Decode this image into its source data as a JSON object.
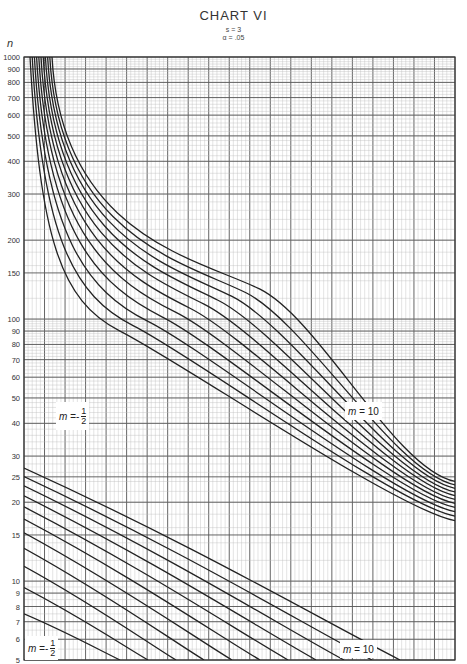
{
  "chart_data": {
    "type": "line",
    "title": "CHART VI",
    "subtitle": [
      "s = 3",
      "α = .05"
    ],
    "ylabel": "n",
    "xlabel": "",
    "yscale": "log",
    "ylim": [
      5,
      1000
    ],
    "y_ticks": [
      1000,
      900,
      800,
      700,
      600,
      500,
      400,
      300,
      200,
      150,
      100,
      90,
      80,
      70,
      60,
      50,
      40,
      30,
      25,
      20,
      15,
      10,
      9,
      8,
      7,
      6,
      5
    ],
    "grid": true,
    "annotations": [
      {
        "text": "m = -1/2",
        "family": "upper",
        "position": "left-middle"
      },
      {
        "text": "m = 10",
        "family": "upper",
        "position": "right-middle"
      },
      {
        "text": "m = -1/2",
        "family": "lower",
        "position": "bottom-left"
      },
      {
        "text": "m = 10",
        "family": "lower",
        "position": "bottom-right"
      }
    ],
    "series_families": [
      {
        "name": "upper family (large n)",
        "curve_count": 11,
        "from_m": -0.5,
        "to_m": 10,
        "description": "Curves start near n=1000 at the far left and decrease to roughly n=17–24 at the right edge"
      },
      {
        "name": "lower family (small n)",
        "curve_count": 11,
        "from_m": -0.5,
        "to_m": 10,
        "description": "Curves start at n≈7.5–27 at the left edge and decrease to n=5 near the right-center"
      }
    ]
  },
  "labels": {
    "title": "CHART VI",
    "s_param": "s = 3",
    "alpha_param": "α = .05",
    "y_axis": "n",
    "m_label_prefix": "m =",
    "m_neg_num": "1",
    "m_neg_den": "2",
    "m_neg_sign": "-",
    "m_pos": "10"
  },
  "y_tick_labels": [
    "1000",
    "900",
    "800",
    "700",
    "600",
    "500",
    "400",
    "300",
    "200",
    "150",
    "100",
    "90",
    "80",
    "70",
    "60",
    "50",
    "40",
    "30",
    "25",
    "20",
    "15",
    "10",
    "9",
    "8",
    "7",
    "6",
    "5"
  ]
}
